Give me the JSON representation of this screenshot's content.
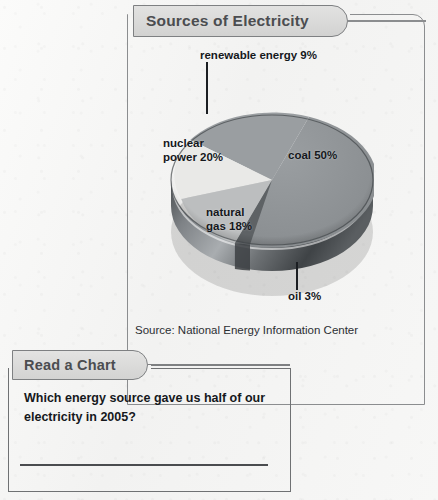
{
  "page": {
    "background_color": "#f6f6f5",
    "ink_color": "#15181c"
  },
  "chart_panel": {
    "tab_label": "Sources of Electricity",
    "source_note": "Source: National Energy Information Center"
  },
  "read_a_chart": {
    "tab_label": "Read a Chart",
    "question": "Which energy source gave us half of our electricity in 2005?",
    "answer_value": ""
  },
  "chart_data": {
    "type": "pie",
    "title": "Sources of Electricity",
    "subtitle": "",
    "xlabel": "",
    "ylabel": "",
    "legend_position": "none",
    "grid": false,
    "annotations": [
      "Source: National Energy Information Center"
    ],
    "categories": [
      "coal",
      "nuclear power",
      "natural gas",
      "renewable energy",
      "oil"
    ],
    "values": [
      50,
      20,
      18,
      9,
      3
    ],
    "units": "percent",
    "slices": [
      {
        "label": "coal 50%",
        "name": "coal",
        "value": 50,
        "color": "#8e9295",
        "leader": false
      },
      {
        "label": "nuclear power 20%",
        "name": "nuclear power",
        "value": 20,
        "color": "#e8e8e6",
        "leader": false
      },
      {
        "label": "natural gas 18%",
        "name": "natural gas",
        "value": 18,
        "color": "#b9bbbc",
        "leader": false
      },
      {
        "label": "renewable energy 9%",
        "name": "renewable energy",
        "value": 9,
        "color": "#9a9ea1",
        "leader": true
      },
      {
        "label": "oil 3%",
        "name": "oil",
        "value": 3,
        "color": "#5e6265",
        "leader": true
      }
    ]
  }
}
